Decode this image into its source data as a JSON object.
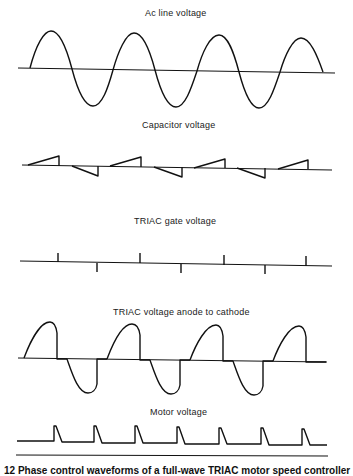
{
  "diagram": {
    "panels": [
      {
        "id": "ac-line",
        "title": "Ac line voltage"
      },
      {
        "id": "capacitor",
        "title": "Capacitor voltage"
      },
      {
        "id": "triac-gate",
        "title": "TRIAC gate voltage"
      },
      {
        "id": "triac-anode",
        "title": "TRIAC voltage anode to cathode"
      },
      {
        "id": "motor",
        "title": "Motor voltage"
      }
    ],
    "caption": "12  Phase control waveforms of a full-wave TRIAC motor speed controller",
    "stroke_color": "#111111"
  }
}
